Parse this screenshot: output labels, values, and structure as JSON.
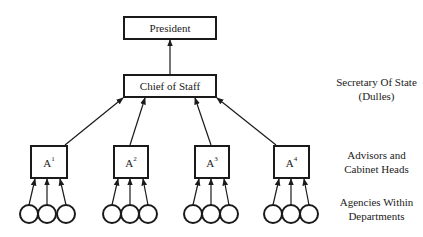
{
  "diagram": {
    "nodes": {
      "president": "President",
      "chief_of_staff": "Chief of Staff",
      "advisors": [
        {
          "base": "A",
          "sup": "1"
        },
        {
          "base": "A",
          "sup": "2"
        },
        {
          "base": "A",
          "sup": "3"
        },
        {
          "base": "A",
          "sup": "4"
        }
      ],
      "agencies_per_advisor": 3
    },
    "side_labels": {
      "level2_line1": "Secretary Of State",
      "level2_line2": "(Dulles)",
      "level3_line1": "Advisors and",
      "level3_line2": "Cabinet Heads",
      "level4_line1": "Agencies Within",
      "level4_line2": "Departments"
    },
    "colors": {
      "stroke": "#1a1a1a",
      "background": "#ffffff"
    }
  }
}
